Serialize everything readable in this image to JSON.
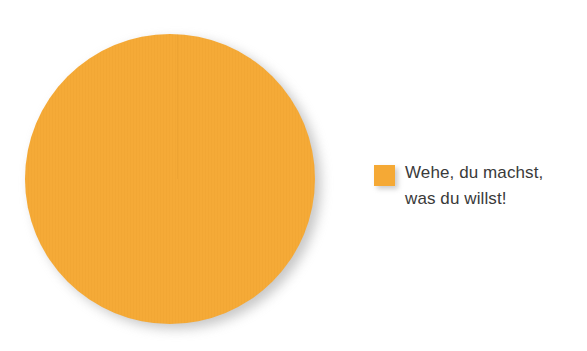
{
  "background_color": "#ffffff",
  "chart_data": {
    "type": "pie",
    "title": "",
    "subtitle": "",
    "xlabel": "",
    "ylabel": "",
    "grid": false,
    "legend_position": "right",
    "categories": [
      "Wehe, du machst, was du willst!"
    ],
    "values": [
      100
    ],
    "value_unit": "%",
    "slice_colors": [
      "#f5a935"
    ],
    "data_labels_visible": false,
    "annotations": [],
    "series": [
      {
        "name": "Wehe, du machst, was du willst!",
        "values": [
          100
        ]
      }
    ]
  },
  "pie": {
    "slice_label": "Wehe, du machst, was du willst!",
    "slice_color": "#f5a935",
    "slice_value": 100,
    "shadow_color": "#9a9a9a"
  },
  "legend": {
    "items": [
      {
        "label": "Wehe, du machst,\nwas du willst!",
        "label_line_1": "Wehe, du machst,",
        "label_line_2": "was du willst!",
        "color": "#f5a935",
        "text_color": "#3a3a3a"
      }
    ]
  }
}
